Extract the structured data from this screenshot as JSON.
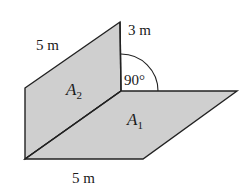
{
  "diagram": {
    "planes": [
      {
        "id": "A2",
        "label": "A",
        "subscript": "2",
        "orientation": "vertical"
      },
      {
        "id": "A1",
        "label": "A",
        "subscript": "1",
        "orientation": "horizontal"
      }
    ],
    "dimensions": {
      "top_edge": "5 m",
      "height": "3 m",
      "bottom_edge": "5 m"
    },
    "angle": {
      "value": "90°"
    },
    "colors": {
      "plane_fill": "#cfcfcf",
      "stroke": "#222222",
      "background": "#ffffff"
    }
  }
}
